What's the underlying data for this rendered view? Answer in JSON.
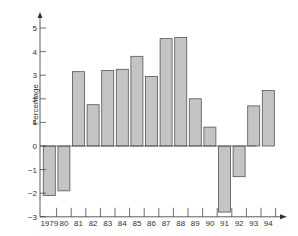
{
  "chart_data": {
    "type": "bar",
    "title": "",
    "xlabel": "",
    "ylabel": "Percentage",
    "categories": [
      "1979",
      "80",
      "81",
      "82",
      "83",
      "84",
      "85",
      "86",
      "87",
      "88",
      "89",
      "90",
      "91",
      "92",
      "93",
      "94"
    ],
    "values": [
      -2.1,
      -1.9,
      3.15,
      1.75,
      3.2,
      3.25,
      3.8,
      2.95,
      4.55,
      4.6,
      2.0,
      0.8,
      -2.8,
      -1.3,
      1.7,
      2.35
    ],
    "ylim": [
      -3,
      5
    ],
    "yticks": [
      -3,
      -2,
      -1,
      0,
      1,
      2,
      3,
      4,
      5
    ],
    "grid": false,
    "legend": null
  },
  "colors": {
    "bar_fill": "#c4c4c4",
    "bar_stroke": "#555555",
    "axis": "#333333"
  }
}
